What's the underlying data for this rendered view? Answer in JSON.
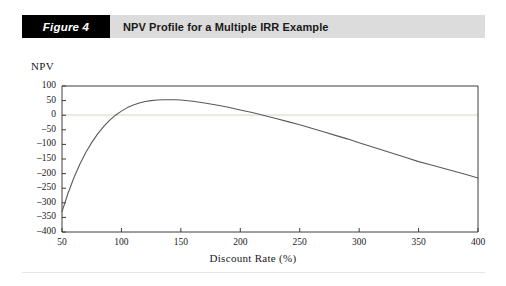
{
  "figure": {
    "tag": "Figure 4",
    "title": "NPV Profile for a Multiple IRR Example"
  },
  "colors": {
    "tag_background": "#000000",
    "tag_text": "#ffffff",
    "title_background": "#dcdcdc",
    "title_text": "#1a1a1a",
    "curve": "#5a5a5a",
    "axis": "#3c3c3c",
    "zero_gridline": "#eceae6",
    "page_background": "#ffffff"
  },
  "chart_data": {
    "type": "line",
    "title": "NPV Profile for a Multiple IRR Example",
    "xlabel": "Discount Rate (%)",
    "ylabel": "NPV",
    "xlim": [
      50,
      400
    ],
    "ylim": [
      -400,
      100
    ],
    "grid": false,
    "zero_line": true,
    "legend": "none",
    "xticks": [
      50,
      100,
      150,
      200,
      250,
      300,
      350,
      400
    ],
    "yticks": [
      100,
      50,
      0,
      -50,
      -100,
      -150,
      -200,
      -250,
      -300,
      -350,
      -400
    ],
    "xtick_labels": [
      "50",
      "100",
      "150",
      "200",
      "250",
      "300",
      "350",
      "400"
    ],
    "ytick_labels": [
      "100",
      "50",
      "0",
      "–50",
      "–100",
      "–150",
      "–200",
      "–250",
      "–300",
      "–350",
      "–400"
    ],
    "series": [
      {
        "name": "NPV",
        "x": [
          50,
          55,
          60,
          65,
          70,
          75,
          80,
          85,
          90,
          95,
          100,
          105,
          110,
          115,
          120,
          125,
          130,
          135,
          140,
          145,
          150,
          160,
          170,
          180,
          190,
          200,
          210,
          220,
          230,
          240,
          250,
          260,
          270,
          280,
          290,
          300,
          310,
          320,
          330,
          340,
          350,
          360,
          370,
          380,
          390,
          400
        ],
        "y": [
          -330,
          -268,
          -214,
          -168,
          -128,
          -94,
          -64,
          -39,
          -18,
          0,
          14,
          26,
          35,
          42,
          47,
          50,
          52,
          53,
          53,
          53,
          52,
          48,
          42,
          35,
          27,
          18,
          9,
          -1,
          -11,
          -22,
          -33,
          -45,
          -57,
          -69,
          -81,
          -94,
          -107,
          -120,
          -133,
          -146,
          -159,
          -170,
          -181,
          -192,
          -203,
          -215
        ]
      }
    ],
    "annotations": {
      "irr_crossings": [
        "≈ 95",
        "≈ 218"
      ],
      "peak": {
        "x": 140,
        "y": 53
      },
      "start": {
        "x": 50,
        "y": -330
      },
      "end": {
        "x": 400,
        "y": -215
      }
    }
  }
}
